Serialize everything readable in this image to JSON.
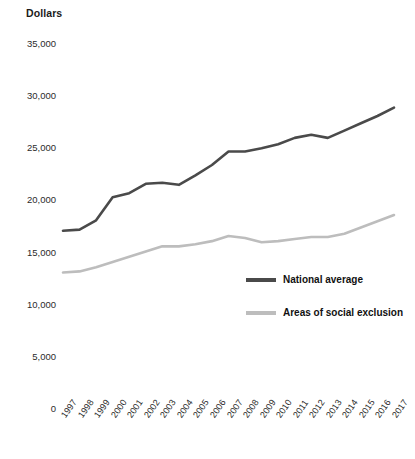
{
  "chart_data": {
    "type": "line",
    "title": "",
    "ylabel": "Dollars",
    "xlabel": "",
    "ylim": [
      0,
      35000
    ],
    "yticks": [
      "0",
      "5,000",
      "10,000",
      "15,000",
      "20,000",
      "25,000",
      "30,000",
      "35,000"
    ],
    "ytick_values": [
      0,
      5000,
      10000,
      15000,
      20000,
      25000,
      30000,
      35000
    ],
    "grid": false,
    "legend_position": "inside-right",
    "categories": [
      "1997",
      "1998",
      "1999",
      "2000",
      "2001",
      "2002",
      "2003",
      "2004",
      "2005",
      "2006",
      "2007",
      "2008",
      "2009",
      "2010",
      "2011",
      "2012",
      "2013",
      "2014",
      "2015",
      "2016",
      "2017"
    ],
    "series": [
      {
        "name": "National average",
        "color": "#4a4a4a",
        "values": [
          17000,
          17100,
          18000,
          20200,
          20600,
          21500,
          21600,
          21400,
          22300,
          23300,
          24600,
          24600,
          24900,
          25300,
          25900,
          26200,
          25900,
          26600,
          27300,
          28000,
          28800
        ]
      },
      {
        "name": "Areas of social exclusion",
        "color": "#bdbdbd",
        "values": [
          13000,
          13100,
          13500,
          14000,
          14500,
          15000,
          15500,
          15500,
          15700,
          16000,
          16500,
          16300,
          15900,
          16000,
          16200,
          16400,
          16400,
          16700,
          17300,
          17900,
          18500
        ]
      }
    ]
  },
  "legend": {
    "items": [
      {
        "label": "National average",
        "color": "#4a4a4a"
      },
      {
        "label": "Areas of social exclusion",
        "color": "#bdbdbd"
      }
    ]
  }
}
